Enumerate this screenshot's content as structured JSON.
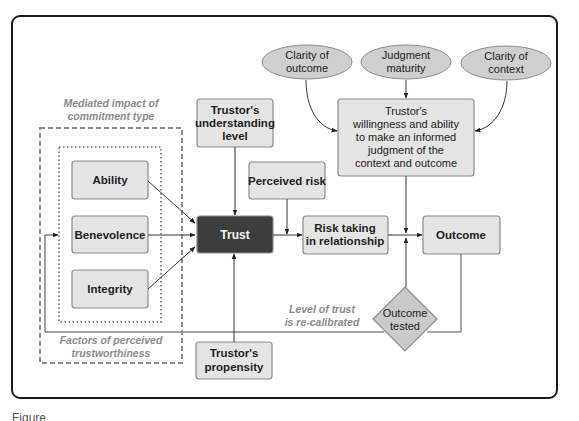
{
  "diagram": {
    "frame": {
      "border_color": "#1a1a1a",
      "background": "#ffffff"
    },
    "colors": {
      "box_fill": "#e4e4e4",
      "box_stroke": "#8c8c8c",
      "trust_fill": "#3d3d3d",
      "ellipse_fill": "#cfcfcf",
      "diamond_fill": "#cacaca",
      "note_color": "#8a8a8a",
      "line_color": "#333333"
    },
    "ellipses": [
      {
        "id": "clarity-outcome",
        "lines": [
          "Clarity of",
          "outcome"
        ]
      },
      {
        "id": "judgment-maturity",
        "lines": [
          "Judgment",
          "maturity"
        ]
      },
      {
        "id": "clarity-context",
        "lines": [
          "Clarity of",
          "context"
        ]
      }
    ],
    "judgment_box": {
      "lines": [
        "Trustor's",
        "willingness and ability",
        "to make an informed",
        "judgment of the",
        "context and outcome"
      ]
    },
    "understanding_box": {
      "lines": [
        "Trustor's",
        "understanding",
        "level"
      ]
    },
    "perceived_risk_box": {
      "label": "Perceived risk"
    },
    "trust_box": {
      "label": "Trust"
    },
    "risk_taking_box": {
      "lines": [
        "Risk taking",
        "in relationship"
      ]
    },
    "outcome_box": {
      "label": "Outcome"
    },
    "outcome_tested": {
      "lines": [
        "Outcome",
        "tested"
      ]
    },
    "propensity_box": {
      "lines": [
        "Trustor's",
        "propensity"
      ]
    },
    "factors": [
      {
        "label": "Ability"
      },
      {
        "label": "Benevolence"
      },
      {
        "label": "Integrity"
      }
    ],
    "notes": {
      "mediated": [
        "Mediated impact of",
        "commitment type"
      ],
      "factors": [
        "Factors of perceived",
        "trustworthiness"
      ],
      "recalibrated": [
        "Level of trust",
        "is re-calibrated"
      ]
    }
  },
  "caption": {
    "text": "Figure"
  }
}
